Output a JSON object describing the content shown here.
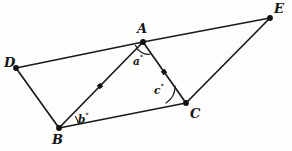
{
  "figure": {
    "background_color": "#fdfdfc",
    "stroke_color": "#1a1a1a",
    "width": 292,
    "height": 151
  },
  "vertices": [
    {
      "id": "D",
      "label": "D",
      "x": 16,
      "y": 68,
      "label_x": 4,
      "label_y": 56
    },
    {
      "id": "A",
      "label": "A",
      "x": 143,
      "y": 42,
      "label_x": 137,
      "label_y": 22
    },
    {
      "id": "E",
      "label": "E",
      "x": 270,
      "y": 18,
      "label_x": 274,
      "label_y": 2
    },
    {
      "id": "B",
      "label": "B",
      "x": 59,
      "y": 128,
      "label_x": 52,
      "label_y": 133
    },
    {
      "id": "C",
      "label": "C",
      "x": 186,
      "y": 103,
      "label_x": 190,
      "label_y": 107
    }
  ],
  "segments": [
    {
      "id": "DA",
      "from": "D",
      "to": "A"
    },
    {
      "id": "AE",
      "from": "A",
      "to": "E"
    },
    {
      "id": "DB",
      "from": "D",
      "to": "B"
    },
    {
      "id": "BA",
      "from": "B",
      "to": "A"
    },
    {
      "id": "AC",
      "from": "A",
      "to": "C"
    },
    {
      "id": "BC",
      "from": "B",
      "to": "C"
    },
    {
      "id": "CE",
      "from": "C",
      "to": "E"
    }
  ],
  "tick_marks": [
    {
      "id": "tick-BA",
      "on_segment": "BA",
      "x": 100,
      "y": 86,
      "size": 4.6,
      "rotation": -35
    },
    {
      "id": "tick-AC",
      "on_segment": "AC",
      "x": 164,
      "y": 72,
      "size": 4.6,
      "rotation": 56
    }
  ],
  "angles": [
    {
      "id": "a",
      "label": "a",
      "degree_symbol": "°",
      "vertex": "A",
      "label_x": 133,
      "label_y": 54,
      "arc": {
        "cx": 143,
        "cy": 42,
        "r": 14,
        "start_deg": 62,
        "end_deg": 122
      }
    },
    {
      "id": "b",
      "label": "b",
      "degree_symbol": "°",
      "vertex": "B",
      "label_x": 78,
      "label_y": 112,
      "arc": {
        "cx": 59,
        "cy": 128,
        "r": 20,
        "start_deg": -13,
        "end_deg": -35
      }
    },
    {
      "id": "c",
      "label": "c",
      "degree_symbol": "°",
      "vertex": "C",
      "label_x": 154,
      "label_y": 83,
      "arc": {
        "cx": 186,
        "cy": 103,
        "r": 20,
        "start_deg": 180,
        "end_deg": 237
      }
    }
  ]
}
